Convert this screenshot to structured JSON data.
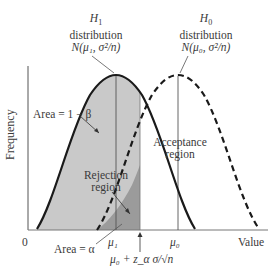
{
  "figure": {
    "y_axis_label": "Frequency",
    "x_axis_label": "Value",
    "origin_label": "0",
    "h1": {
      "title": "H",
      "sub": "1",
      "line2": "distribution",
      "line3": "N(μ₁, σ²/n)"
    },
    "h0": {
      "title": "H",
      "sub": "0",
      "line2": "distribution",
      "line3": "N(μ₀, σ²/n)"
    },
    "area_power_label": "Area = 1 − β",
    "acceptance_label_1": "Acceptance",
    "acceptance_label_2": "region",
    "rejection_label_1": "Rejection",
    "rejection_label_2": "region",
    "area_alpha_label": "Area = α",
    "mu1_label": "μ₁",
    "mu0_label": "μ₀",
    "critical_label": "μ₀ + z_α σ/√n",
    "colors": {
      "curve": "#1a1a1a",
      "light_fill": "#c8c8c8",
      "dark_fill": "#9a9a9a",
      "axis": "#555555",
      "text": "#3a3a3a"
    }
  }
}
